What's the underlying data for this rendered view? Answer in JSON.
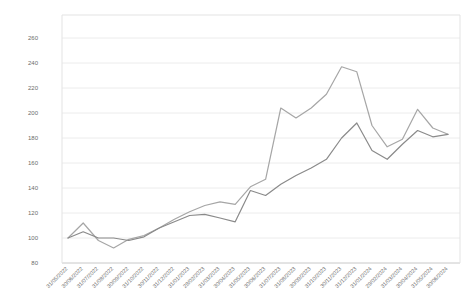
{
  "chart_data": {
    "type": "line",
    "title": "",
    "xlabel": "",
    "ylabel": "",
    "background_color": "#ffffff",
    "grid": true,
    "grid_color": "#ececec",
    "axis_line_color": "#c8c8c8",
    "plot_border_color": "#e3e3e3",
    "tick_label_color": "#6b6b6b",
    "legend": "none",
    "ylim": [
      80,
      260
    ],
    "yticks": [
      80,
      100,
      120,
      140,
      160,
      180,
      200,
      220,
      240,
      260
    ],
    "x": [
      "31/05/2022",
      "30/06/2022",
      "31/07/2022",
      "31/08/2022",
      "30/09/2022",
      "31/10/2022",
      "30/11/2022",
      "31/12/2022",
      "31/01/2023",
      "28/02/2023",
      "31/03/2023",
      "30/04/2023",
      "31/05/2023",
      "30/06/2023",
      "31/07/2023",
      "31/08/2023",
      "30/09/2023",
      "31/10/2023",
      "30/11/2023",
      "31/12/2023",
      "31/01/2024",
      "29/02/2024",
      "31/03/2024",
      "30/04/2024",
      "31/05/2024",
      "30/06/2024"
    ],
    "series": [
      {
        "name": "line-1",
        "color": "#a6a6a6",
        "values": [
          100,
          112,
          98,
          92,
          99,
          102,
          108,
          115,
          121,
          126,
          129,
          127,
          141,
          147,
          204,
          196,
          204,
          215,
          237,
          233,
          190,
          173,
          179,
          203,
          188,
          183
        ]
      },
      {
        "name": "line-2",
        "color": "#8a8a8a",
        "values": [
          100,
          105,
          100,
          100,
          98,
          101,
          108,
          113,
          118,
          119,
          116,
          113,
          138,
          134,
          143,
          150,
          156,
          163,
          180,
          192,
          170,
          163,
          175,
          186,
          181,
          183
        ]
      }
    ]
  }
}
